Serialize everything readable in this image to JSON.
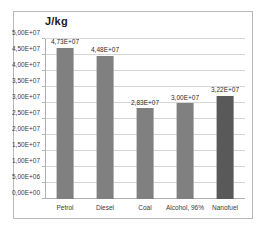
{
  "chart_data": {
    "type": "bar",
    "title": "J/kg",
    "xlabel": "",
    "ylabel": "",
    "categories": [
      "Petrol",
      "Diesel",
      "Coal",
      "Alcohol, 96%",
      "Nanofuel"
    ],
    "values": [
      47300000,
      44800000,
      28300000,
      30000000,
      32200000
    ],
    "data_labels": [
      "4,73E+07",
      "4,48E+07",
      "2,83E+07",
      "3,00E+07",
      "3,22E+07"
    ],
    "bar_colors": [
      "#808080",
      "#808080",
      "#808080",
      "#808080",
      "#595959"
    ],
    "ylim": [
      0,
      50000000
    ],
    "ytick_values": [
      0,
      5000000,
      10000000,
      15000000,
      20000000,
      25000000,
      30000000,
      35000000,
      40000000,
      45000000,
      50000000
    ],
    "ytick_labels": [
      "0,00E+00",
      "5,00E+06",
      "1,00E+07",
      "1,50E+07",
      "2,00E+07",
      "2,50E+07",
      "3,00E+07",
      "3,50E+07",
      "4,00E+07",
      "4,50E+07",
      "5,00E+07"
    ],
    "grid": "horizontal",
    "legend": "none",
    "gridline_color": "#d6d6d6",
    "axis_color": "#b0b0b0",
    "border_color": "#b8b8b8",
    "background": "#ffffff"
  }
}
